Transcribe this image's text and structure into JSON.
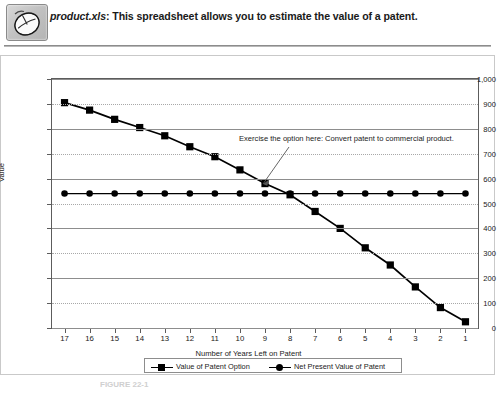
{
  "header": {
    "icon": "mouse-icon",
    "filename": "product.xls",
    "separator": ":",
    "description": "This spreadsheet allows you to estimate the value of a patent."
  },
  "chart_data": {
    "type": "line",
    "title": "",
    "xlabel": "Number of Years Left on Patent",
    "ylabel": "Value",
    "categories": [
      "17",
      "16",
      "15",
      "14",
      "13",
      "12",
      "11",
      "10",
      "9",
      "8",
      "7",
      "6",
      "5",
      "4",
      "3",
      "2",
      "1"
    ],
    "ylim": [
      0,
      1000
    ],
    "yticks": [
      "0",
      "100",
      "200",
      "300",
      "400",
      "500",
      "600",
      "700",
      "800",
      "900",
      "1,000"
    ],
    "ytick_values": [
      0,
      100,
      200,
      300,
      400,
      500,
      600,
      700,
      800,
      900,
      1000
    ],
    "grid": true,
    "legend_position": "bottom",
    "series": [
      {
        "name": "Value of Patent Option",
        "marker": "square",
        "color": "#000000",
        "values": [
          905,
          875,
          838,
          805,
          772,
          728,
          688,
          635,
          580,
          535,
          468,
          400,
          322,
          253,
          165,
          82,
          25
        ]
      },
      {
        "name": "Net Present Value of Patent",
        "marker": "circle",
        "color": "#000000",
        "values": [
          540,
          540,
          540,
          540,
          540,
          540,
          540,
          540,
          540,
          540,
          540,
          540,
          540,
          540,
          540,
          540,
          540
        ]
      }
    ],
    "annotations": [
      {
        "text": "Exercise the option here: Convert patent to commercial product.",
        "points_to_category": "8",
        "points_to_value": 535
      }
    ]
  },
  "caption": {
    "label": "FIGURE 22-1"
  }
}
